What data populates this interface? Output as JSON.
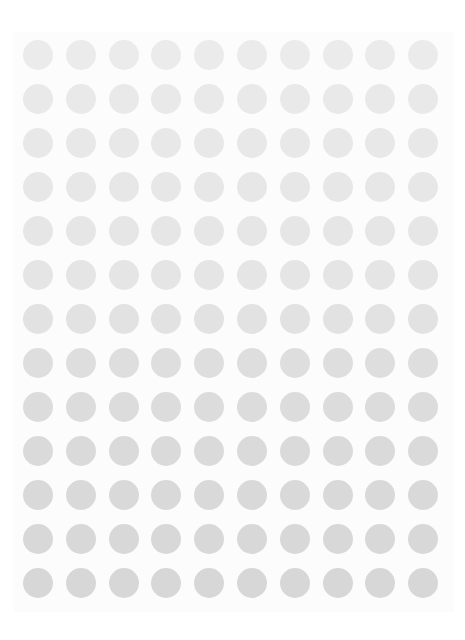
{
  "grid": {
    "rows": 13,
    "cols": 10,
    "origin_x": 38,
    "origin_y": 55,
    "step_x": 42.8,
    "step_y": 44,
    "diameter": 30,
    "row_colors": [
      "#ebebeb",
      "#e9e9e9",
      "#e8e8e8",
      "#e7e7e7",
      "#e6e6e6",
      "#e5e5e5",
      "#e2e2e2",
      "#dedede",
      "#dcdcdc",
      "#dadada",
      "#d9d9d9",
      "#d8d8d8",
      "#d7d7d7"
    ]
  }
}
